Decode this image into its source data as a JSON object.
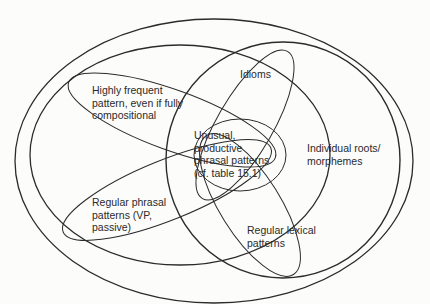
{
  "diagram": {
    "type": "nested-overlapping-ellipses",
    "stroke_color": "#2b2b2b",
    "background": "#fcfcfb",
    "regions": {
      "outer": {
        "label": ""
      },
      "inner_left": {
        "label": ""
      },
      "individual_roots": {
        "lines": [
          "Individual roots/",
          "morphemes"
        ]
      },
      "highly_frequent": {
        "lines": [
          "Highly frequent",
          "pattern, even if fully",
          "compositional"
        ]
      },
      "regular_phrasal": {
        "lines": [
          "Regular phrasal",
          "patterns (VP,",
          "passive)"
        ]
      },
      "idioms": {
        "lines": [
          "Idioms"
        ]
      },
      "regular_lexical": {
        "lines": [
          "Regular lexical",
          "patterns"
        ]
      },
      "unusual_productive": {
        "lines": [
          "Unusual,",
          "productive",
          "phrasal patterns",
          "(cf. table 15.1)"
        ]
      }
    }
  }
}
